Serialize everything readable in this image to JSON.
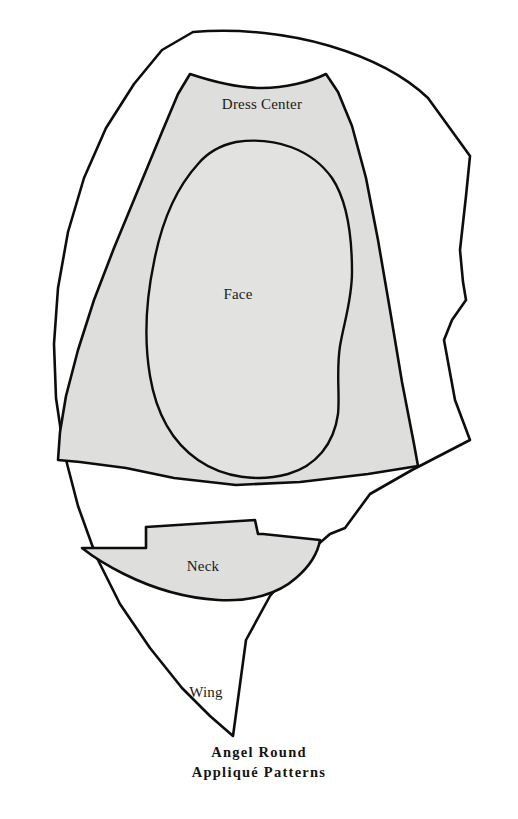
{
  "sheet": {
    "title": "Angel Round Appliqué Patterns",
    "background_color": "#ffffff",
    "ink_color": "#0d0d0d",
    "fill_color": "#dededc"
  },
  "pieces": [
    {
      "id": "wing",
      "label": "Wing",
      "label_x": 206,
      "label_y": 692,
      "fill": "#ffffff",
      "stroke": "#0d0d0d"
    },
    {
      "id": "dress-center",
      "label": "Dress Center",
      "label_x": 262,
      "label_y": 104,
      "fill": "#dededc",
      "stroke": "#0d0d0d"
    },
    {
      "id": "face",
      "label": "Face",
      "label_x": 238,
      "label_y": 294,
      "fill": "#e2e2e0",
      "stroke": "#0d0d0d"
    },
    {
      "id": "neck",
      "label": "Neck",
      "label_x": 203,
      "label_y": 566,
      "fill": "#dededc",
      "stroke": "#0d0d0d"
    }
  ],
  "caption": {
    "line1": "Angel Round",
    "line2": "Appliqué Patterns"
  }
}
